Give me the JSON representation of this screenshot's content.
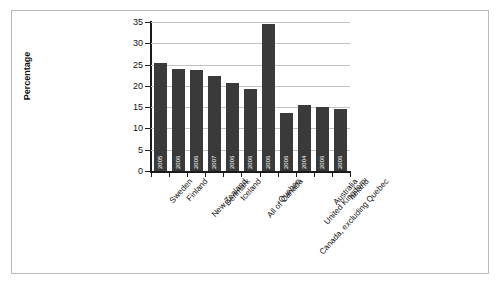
{
  "chart_data": {
    "type": "bar",
    "title": "",
    "xlabel": "",
    "ylabel": "Percentage",
    "ylim": [
      0,
      35
    ],
    "yticks": [
      0,
      5,
      10,
      15,
      20,
      25,
      30,
      35
    ],
    "grid": true,
    "legend": "none",
    "bar_color": "#3a3a3a",
    "categories": [
      "Sweden",
      "Finland",
      "New Zealand",
      "Denmark",
      "Iceland",
      "All of Canada",
      "Quebec",
      "Canada, excluding Quebec",
      "United Kingdom",
      "Australia",
      "Ireland"
    ],
    "point_labels": [
      "2005",
      "2006",
      "2006",
      "2007",
      "2006",
      "2006",
      "2006",
      "2006",
      "2004",
      "2006",
      "2006"
    ],
    "values": [
      25.3,
      23.9,
      23.8,
      22.3,
      20.7,
      19.3,
      34.5,
      13.6,
      15.6,
      15.1,
      14.5
    ]
  },
  "footnote": {
    "text": ""
  }
}
